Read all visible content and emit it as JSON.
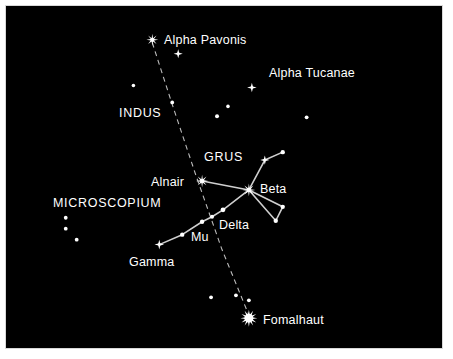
{
  "chart": {
    "type": "star-map",
    "canvas": {
      "width": 453,
      "height": 359
    },
    "sky": {
      "x": 5,
      "y": 5,
      "width": 438,
      "height": 344
    },
    "colors": {
      "background": "#ffffff",
      "sky": "#000000",
      "star": "#ffffff",
      "line": "#cfcfcf",
      "dashed_line": "#bdbdbd",
      "label": "#ffffff",
      "frame": "#d8d8d8"
    }
  },
  "labels": [
    {
      "id": "alpha-pavonis",
      "text": "Alpha Pavonis",
      "x": 163,
      "y": 33,
      "kind": "proper"
    },
    {
      "id": "alpha-tucanae",
      "text": "Alpha Tucanae",
      "x": 268,
      "y": 66,
      "kind": "proper"
    },
    {
      "id": "indus",
      "text": "INDUS",
      "x": 118,
      "y": 106,
      "kind": "constellation"
    },
    {
      "id": "grus",
      "text": "GRUS",
      "x": 203,
      "y": 150,
      "kind": "constellation"
    },
    {
      "id": "alnair",
      "text": "Alnair",
      "x": 150,
      "y": 175,
      "kind": "proper"
    },
    {
      "id": "beta",
      "text": "Beta",
      "x": 259,
      "y": 182,
      "kind": "greek"
    },
    {
      "id": "microscopium",
      "text": "MICROSCOPIUM",
      "x": 52,
      "y": 196,
      "kind": "constellation"
    },
    {
      "id": "delta",
      "text": "Delta",
      "x": 218,
      "y": 218,
      "kind": "greek"
    },
    {
      "id": "mu",
      "text": "Mu",
      "x": 190,
      "y": 230,
      "kind": "greek"
    },
    {
      "id": "gamma",
      "text": "Gamma",
      "x": 128,
      "y": 255,
      "kind": "proper"
    },
    {
      "id": "fomalhaut",
      "text": "Fomalhaut",
      "x": 262,
      "y": 313,
      "kind": "proper"
    }
  ],
  "stars": [
    {
      "id": "alpha-pavonis-star",
      "name": "Alpha Pavonis",
      "x": 152,
      "y": 39,
      "r": 6.0,
      "glyph": "burst8",
      "magnitude": "bright"
    },
    {
      "id": "pavonis-companion",
      "name": "unlabeled star near Alpha Pavonis",
      "x": 178,
      "y": 53,
      "r": 4.6,
      "glyph": "burst4",
      "magnitude": "medium"
    },
    {
      "id": "alpha-tucanae-star",
      "name": "Alpha Tucanae",
      "x": 252,
      "y": 87,
      "r": 4.8,
      "glyph": "burst4",
      "magnitude": "medium"
    },
    {
      "id": "alnair-star",
      "name": "Alnair",
      "x": 202,
      "y": 181,
      "r": 6.2,
      "glyph": "burst8",
      "magnitude": "bright"
    },
    {
      "id": "beta-star",
      "name": "Beta Gruis",
      "x": 249,
      "y": 190,
      "r": 6.4,
      "glyph": "burst8",
      "magnitude": "bright"
    },
    {
      "id": "grus-upper-star",
      "name": "unlabeled star north of Beta",
      "x": 265,
      "y": 160,
      "r": 4.6,
      "glyph": "burst4",
      "magnitude": "medium"
    },
    {
      "id": "gamma-star",
      "name": "Gamma Gruis",
      "x": 159,
      "y": 245,
      "r": 4.8,
      "glyph": "burst4",
      "magnitude": "medium"
    },
    {
      "id": "fomalhaut-star",
      "name": "Fomalhaut",
      "x": 249,
      "y": 319,
      "r": 8.5,
      "glyph": "burst12",
      "magnitude": "very-bright"
    }
  ],
  "dots": [
    {
      "id": "dot-indus-a",
      "x": 133,
      "y": 85,
      "r": 1.8
    },
    {
      "id": "dot-indus-b",
      "x": 172,
      "y": 102,
      "r": 1.9
    },
    {
      "id": "dot-tuc-a",
      "x": 228,
      "y": 106,
      "r": 1.8
    },
    {
      "id": "dot-tuc-b",
      "x": 217,
      "y": 116,
      "r": 2.0
    },
    {
      "id": "dot-right-edge",
      "x": 307,
      "y": 117,
      "r": 1.9
    },
    {
      "id": "dot-grus-ne",
      "x": 283,
      "y": 152,
      "r": 2.2
    },
    {
      "id": "dot-tri-right",
      "x": 283,
      "y": 207,
      "r": 2.2
    },
    {
      "id": "dot-tri-bottom",
      "x": 276,
      "y": 221,
      "r": 2.2
    },
    {
      "id": "dot-delta",
      "x": 223,
      "y": 210,
      "r": 2.4
    },
    {
      "id": "dot-chain-a",
      "x": 212,
      "y": 217,
      "r": 2.0
    },
    {
      "id": "dot-mu",
      "x": 202,
      "y": 222,
      "r": 2.2
    },
    {
      "id": "dot-chain-b",
      "x": 182,
      "y": 235,
      "r": 2.2
    },
    {
      "id": "dot-micro-a",
      "x": 65,
      "y": 218,
      "r": 1.9
    },
    {
      "id": "dot-micro-b",
      "x": 65,
      "y": 229,
      "r": 1.9
    },
    {
      "id": "dot-micro-c",
      "x": 76,
      "y": 240,
      "r": 1.9
    },
    {
      "id": "dot-south-a",
      "x": 211,
      "y": 298,
      "r": 1.9
    },
    {
      "id": "dot-south-b",
      "x": 236,
      "y": 296,
      "r": 1.9
    },
    {
      "id": "dot-south-c",
      "x": 249,
      "y": 301,
      "r": 1.9
    }
  ],
  "constellation_lines": [
    {
      "id": "line-alnair-beta",
      "from": [
        202,
        181
      ],
      "to": [
        249,
        190
      ]
    },
    {
      "id": "line-beta-north",
      "from": [
        249,
        190
      ],
      "to": [
        265,
        160
      ]
    },
    {
      "id": "line-north-ne",
      "from": [
        265,
        160
      ],
      "to": [
        283,
        152
      ]
    },
    {
      "id": "line-beta-triright",
      "from": [
        249,
        190
      ],
      "to": [
        283,
        207
      ]
    },
    {
      "id": "line-triright-tribottom",
      "from": [
        283,
        207
      ],
      "to": [
        276,
        221
      ]
    },
    {
      "id": "line-tribottom-beta",
      "from": [
        276,
        221
      ],
      "to": [
        249,
        190
      ]
    },
    {
      "id": "line-beta-delta",
      "from": [
        249,
        190
      ],
      "to": [
        223,
        210
      ]
    },
    {
      "id": "line-delta-chaina",
      "from": [
        223,
        210
      ],
      "to": [
        212,
        217
      ]
    },
    {
      "id": "line-chaina-mu",
      "from": [
        212,
        217
      ],
      "to": [
        202,
        222
      ]
    },
    {
      "id": "line-mu-chainb",
      "from": [
        202,
        222
      ],
      "to": [
        182,
        235
      ]
    },
    {
      "id": "line-chainb-gamma",
      "from": [
        182,
        235
      ],
      "to": [
        159,
        245
      ]
    }
  ],
  "dashed_path": {
    "id": "ecliptic-meridian-dashed",
    "points": [
      [
        152,
        42
      ],
      [
        172,
        104
      ],
      [
        196,
        176
      ],
      [
        222,
        250
      ],
      [
        249,
        316
      ]
    ],
    "dash": "5 4"
  }
}
